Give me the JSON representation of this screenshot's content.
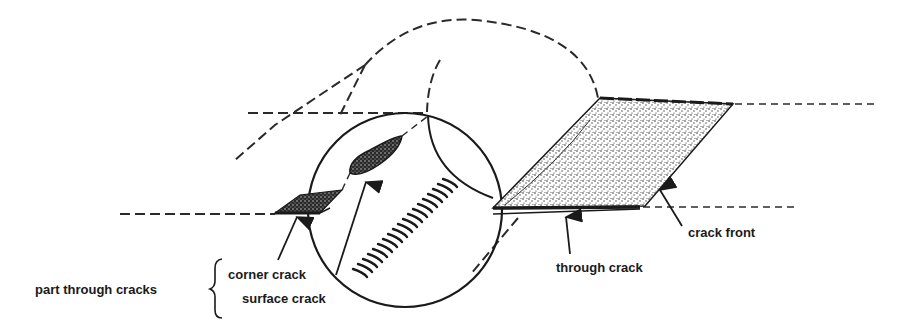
{
  "diagram": {
    "type": "crack-types-in-cylinder",
    "labels": {
      "group": "part through cracks",
      "corner_crack": "corner crack",
      "surface_crack": "surface crack",
      "through_crack": "through crack",
      "crack_front": "crack front"
    },
    "colors": {
      "ink": "#1a1a1a",
      "background": "#ffffff",
      "stipple": "#333333"
    }
  }
}
